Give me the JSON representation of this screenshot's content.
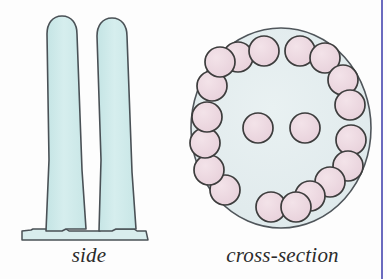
{
  "figure": {
    "background_color": "#fdfdfd",
    "width": 387,
    "height": 279
  },
  "labels": {
    "side": "side",
    "cross_section": "cross-section"
  },
  "colors": {
    "cilium_fill": "#cfe8e8",
    "cilium_stroke": "#4a5156",
    "membrane_fill": "#d8eded",
    "cross_section_fill": "#e3ecee",
    "cross_section_stroke": "#50565b",
    "microtubule_fill": "#ecd6de",
    "microtubule_stroke": "#3c3c3c",
    "right_rule": "#6b6bbf"
  },
  "side_view": {
    "name": "side-view",
    "cilia_count": 2,
    "cilia": [
      {
        "name": "cilium-left",
        "tip_x": 62,
        "tip_y": 16,
        "base_x": 48,
        "base_y": 229,
        "half_width_top": 13,
        "half_width_base": 19
      },
      {
        "name": "cilium-right",
        "tip_x": 112,
        "tip_y": 18,
        "base_x": 118,
        "base_y": 229,
        "half_width_top": 13,
        "half_width_base": 19
      }
    ],
    "membrane": {
      "name": "membrane-base",
      "x1": 22,
      "x2": 152,
      "y_top": 229,
      "y_bottom": 240
    }
  },
  "cross_section": {
    "name": "cross-section-view",
    "structure": "9+2 axoneme",
    "circle": {
      "cx": 281,
      "cy": 128,
      "rx": 90,
      "ry": 100
    },
    "outer_doublets": 9,
    "central_singlets": 2,
    "tubule_radius": 15,
    "doublet_separation": 27,
    "doublet_angles_deg": [
      -70,
      -30,
      10,
      50,
      90,
      130,
      170,
      210,
      250
    ],
    "central_pair": [
      {
        "name": "central-singlet-left",
        "cx": 258,
        "cy": 128
      },
      {
        "name": "central-singlet-right",
        "cx": 305,
        "cy": 128
      }
    ]
  }
}
